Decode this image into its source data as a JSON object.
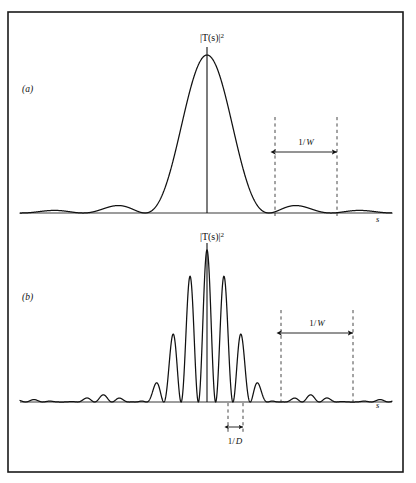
{
  "figure": {
    "background_color": "#ffffff",
    "ink_color": "#111111",
    "frame": {
      "x": 8,
      "y": 12,
      "width": 395,
      "height": 460
    },
    "panels": [
      {
        "id": "a",
        "label": "(a)",
        "label_x": 22,
        "label_y": 92,
        "curve_label": "|T(s)|²",
        "curve_label_main": "|T(s)|",
        "curve_label_exponent": "2",
        "curve_label_x": 212,
        "curve_label_y": 41,
        "axis_label": "s",
        "axis_label_x": 376,
        "axis_label_y": 222,
        "baseline_y": 213,
        "axis_x_start": 20,
        "axis_x_end": 392,
        "center_x": 207,
        "peak_y": 55,
        "center_tick_top": 47,
        "markers": [
          {
            "name": "left-zero-marker",
            "x": 275,
            "y_top": 117,
            "y_bottom": 216
          },
          {
            "name": "right-zero-marker",
            "x": 337,
            "y_top": 117,
            "y_bottom": 216
          }
        ],
        "measure": {
          "label": "1/W",
          "label_numerator": "1/",
          "label_symbol": "W",
          "x_left": 275,
          "x_right": 337,
          "arrow_y": 152,
          "label_x": 306,
          "label_y": 145
        }
      },
      {
        "id": "b",
        "label": "(b)",
        "label_x": 22,
        "label_y": 300,
        "curve_label": "|T(s)|²",
        "curve_label_main": "|T(s)|",
        "curve_label_exponent": "2",
        "curve_label_x": 212,
        "curve_label_y": 240,
        "axis_label": "s",
        "axis_label_x": 376,
        "axis_label_y": 408,
        "baseline_y": 402,
        "axis_x_start": 20,
        "axis_x_end": 392,
        "center_x": 207,
        "peak_y": 250,
        "center_tick_top": 243,
        "markers": [
          {
            "name": "left-envelope-zero-marker",
            "x": 281,
            "y_top": 310,
            "y_bottom": 404
          },
          {
            "name": "right-envelope-zero-marker",
            "x": 353,
            "y_top": 310,
            "y_bottom": 404
          },
          {
            "name": "fringe-left-marker",
            "x": 228,
            "y_top": 403,
            "y_bottom": 432
          },
          {
            "name": "fringe-right-marker",
            "x": 243,
            "y_top": 403,
            "y_bottom": 432
          }
        ],
        "measure": {
          "label": "1/W",
          "label_numerator": "1/",
          "label_symbol": "W",
          "x_left": 281,
          "x_right": 353,
          "arrow_y": 333,
          "label_x": 317,
          "label_y": 326
        },
        "measure_fringe": {
          "label": "1/D",
          "label_numerator": "1/",
          "label_symbol": "D",
          "x_left": 228,
          "x_right": 243,
          "arrow_y": 427,
          "label_x": 235,
          "label_y": 444
        }
      }
    ]
  },
  "chart_data": {
    "type": "line",
    "title": "",
    "xlabel": "s",
    "ylabel": "|T(s)|²",
    "grid": false,
    "legend": null,
    "charts": [
      {
        "id": "a",
        "type": "line",
        "title": "|T(s)|²",
        "xlabel": "s",
        "ylabel": "",
        "function": "sinc_squared",
        "xlim": [
          -6.2,
          6.2
        ],
        "ylim": [
          0,
          1.0
        ],
        "envelope_half_width": 1.0,
        "annotations": [
          {
            "text": "1/W",
            "x_from": 1.0,
            "x_to": 2.0,
            "y": 0.39,
            "type": "double-arrow"
          }
        ],
        "key_points": [
          {
            "x": 0.0,
            "y": 1.0,
            "note": "central maximum"
          },
          {
            "x": 1.0,
            "y": 0.0,
            "note": "first zero"
          },
          {
            "x": 1.5,
            "y": 0.045,
            "note": "first sidelobe maximum"
          },
          {
            "x": 2.0,
            "y": 0.0,
            "note": "second zero"
          },
          {
            "x": 2.5,
            "y": 0.016,
            "note": "second sidelobe maximum"
          },
          {
            "x": -1.5,
            "y": 0.045,
            "note": "first sidelobe maximum (left)"
          }
        ]
      },
      {
        "id": "b",
        "type": "line",
        "title": "|T(s)|²",
        "xlabel": "s",
        "ylabel": "",
        "function": "sinc_squared_times_fringes",
        "xlim": [
          -6.2,
          6.2
        ],
        "ylim": [
          0,
          1.0
        ],
        "envelope_half_width": 1.0,
        "fringe_spacing": 0.24,
        "annotations": [
          {
            "text": "1/W",
            "x_from": 1.2,
            "x_to": 2.36,
            "y": 0.43,
            "type": "double-arrow"
          },
          {
            "text": "1/D",
            "x_from": -0.35,
            "x_to": -0.11,
            "y": -0.16,
            "type": "double-arrow"
          }
        ],
        "key_points": [
          {
            "x": 0.0,
            "y": 1.0,
            "note": "central fringe, tallest"
          },
          {
            "x": 0.24,
            "y": 0.66,
            "note": "first fringe right"
          },
          {
            "x": -0.24,
            "y": 0.66,
            "note": "first fringe left"
          },
          {
            "x": 0.48,
            "y": 0.45,
            "note": "second fringe right"
          },
          {
            "x": -0.48,
            "y": 0.45,
            "note": "second fringe left"
          },
          {
            "x": 0.72,
            "y": 0.16,
            "note": "third fringe right"
          },
          {
            "x": -0.72,
            "y": 0.16,
            "note": "third fringe left"
          },
          {
            "x": 0.96,
            "y": 0.03,
            "note": "fourth fringe right, near envelope zero"
          }
        ]
      }
    ]
  }
}
